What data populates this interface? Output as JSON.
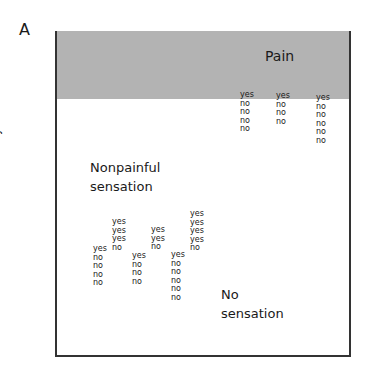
{
  "panel_label": "A",
  "y_axis_label": "Stimulus intensity",
  "regions": {
    "pain": "Pain",
    "nonpainful": [
      "Nonpainful",
      "sensation"
    ],
    "none": [
      "No",
      "sensation"
    ]
  },
  "colors": {
    "pain_region": "#b3b3b3",
    "frame": "#333333"
  },
  "columns": [
    {
      "x": 93,
      "y": 245,
      "responses": [
        "yes",
        "no",
        "no",
        "no",
        "no"
      ]
    },
    {
      "x": 112,
      "y": 218,
      "responses": [
        "yes",
        "yes",
        "yes",
        "no"
      ]
    },
    {
      "x": 132,
      "y": 252,
      "responses": [
        "yes",
        "no",
        "no",
        "no"
      ]
    },
    {
      "x": 151,
      "y": 226,
      "responses": [
        "yes",
        "yes",
        "no"
      ]
    },
    {
      "x": 171,
      "y": 251,
      "responses": [
        "yes",
        "no",
        "no",
        "no",
        "no",
        "no"
      ]
    },
    {
      "x": 190,
      "y": 210,
      "responses": [
        "yes",
        "yes",
        "yes",
        "yes",
        "no"
      ]
    },
    {
      "x": 240,
      "y": 91,
      "responses": [
        "yes",
        "no",
        "no",
        "no",
        "no"
      ]
    },
    {
      "x": 276,
      "y": 92,
      "responses": [
        "yes",
        "no",
        "no",
        "no"
      ]
    },
    {
      "x": 316,
      "y": 94,
      "responses": [
        "yes",
        "no",
        "no",
        "no",
        "no",
        "no"
      ]
    }
  ]
}
